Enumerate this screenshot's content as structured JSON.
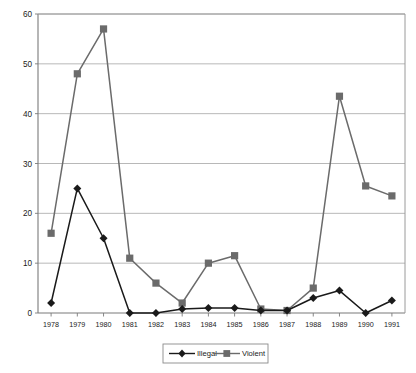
{
  "chart_data": {
    "type": "line",
    "title": "",
    "subtitle": "",
    "xlabel": "",
    "ylabel": "",
    "categories": [
      "1978",
      "1979",
      "1980",
      "1981",
      "1982",
      "1983",
      "1984",
      "1985",
      "1986",
      "1987",
      "1988",
      "1989",
      "1990",
      "1991"
    ],
    "series": [
      {
        "name": "Illegal",
        "marker": "diamond",
        "color": "#1a1a1a",
        "values": [
          2,
          25,
          15,
          0,
          0,
          0.8,
          1,
          1,
          0.5,
          0.5,
          3,
          4.5,
          0,
          2.5
        ]
      },
      {
        "name": "Violent",
        "marker": "square",
        "color": "#6b6b6b",
        "values": [
          16,
          48,
          57,
          11,
          6,
          2,
          10,
          11.5,
          0.8,
          0.5,
          5,
          43.5,
          25.5,
          23.5
        ]
      }
    ],
    "ylim": [
      0,
      60
    ],
    "yticks": [
      0,
      10,
      20,
      30,
      40,
      50,
      60
    ],
    "ytick_labels": [
      "0",
      "10",
      "20",
      "30",
      "40",
      "50",
      "60"
    ],
    "grid": true,
    "grid_axis": "y",
    "legend_position": "bottom",
    "legend_entries": [
      "Illegal",
      "Violent"
    ]
  },
  "colors": {
    "illegal": "#1a1a1a",
    "violent": "#6b6b6b",
    "grid": "#b0b0b0",
    "axis": "#7a7a7a",
    "background": "#ffffff"
  }
}
